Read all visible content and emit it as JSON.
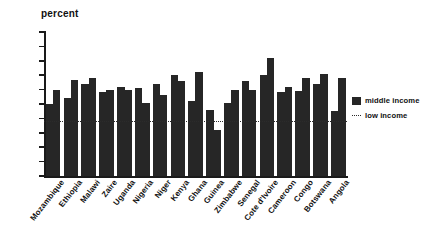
{
  "chart_data": {
    "type": "bar",
    "title": "",
    "ylabel": "percent",
    "xlabel": "",
    "ylim": [
      0,
      5
    ],
    "ytick_labels": [
      "0",
      "0.5",
      "1",
      "1.5",
      "2",
      "2.5",
      "3",
      "3.5",
      "4",
      "4.5",
      "5"
    ],
    "ytick_values": [
      0,
      0.5,
      1,
      1.5,
      2,
      2.5,
      3,
      3.5,
      4,
      4.5,
      5
    ],
    "grid": false,
    "legend_position": "right",
    "legend": [
      {
        "label": "middle income",
        "style": "solid-bar",
        "color": "#262626"
      },
      {
        "label": "low income",
        "style": "dotted-line",
        "color": "#2b2b2b"
      }
    ],
    "reference_lines": [
      {
        "label": "low income",
        "value": 1.9,
        "style": "dotted"
      }
    ],
    "categories": [
      "Mozambique",
      "Ethiopia",
      "Malawi",
      "Zaire",
      "Uganda",
      "Nigeria",
      "Niger",
      "Kenya",
      "Ghana",
      "Guinea",
      "Zimbabwe",
      "Senegal",
      "Cote d'Ivoire",
      "Cameroon",
      "Congo",
      "Botswana",
      "Angola"
    ],
    "series": [
      {
        "name": "bar-1",
        "values": [
          2.5,
          2.7,
          3.2,
          2.9,
          3.1,
          3.05,
          3.2,
          3.5,
          2.6,
          2.3,
          2.55,
          3.3,
          3.5,
          2.9,
          2.95,
          3.2,
          2.25
        ]
      },
      {
        "name": "bar-2",
        "values": [
          3.0,
          3.35,
          3.4,
          3.0,
          3.0,
          2.55,
          2.8,
          3.3,
          3.6,
          1.6,
          3.0,
          3.0,
          4.1,
          3.1,
          3.4,
          3.55,
          3.4
        ]
      }
    ]
  },
  "legend": {
    "middle_income": "middle income",
    "low_income": "low income"
  }
}
